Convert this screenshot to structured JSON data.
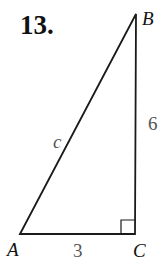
{
  "problem_number": "13.",
  "triangle": {
    "vertices": {
      "A": {
        "label": "A",
        "x": 20,
        "y": 234
      },
      "B": {
        "label": "B",
        "x": 136,
        "y": 14
      },
      "C": {
        "label": "C",
        "x": 135,
        "y": 234
      }
    },
    "sides": {
      "hypotenuse": {
        "label": "c"
      },
      "BC": {
        "label": "6"
      },
      "AC": {
        "label": "3"
      }
    },
    "right_angle_at": "C"
  },
  "colors": {
    "line": "#1a1a1a",
    "side_label": "#555555",
    "vertex_label": "#111111"
  }
}
